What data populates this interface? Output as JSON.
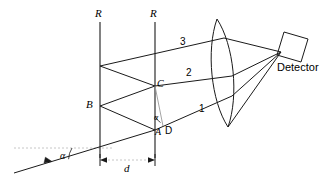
{
  "figure": {
    "type": "optics-ray-diagram",
    "width": 336,
    "height": 179,
    "background_color": "#ffffff",
    "line_color": "#000000",
    "guide_color": "#b0b0b0"
  },
  "labels": {
    "reflector_left": "R",
    "reflector_right": "R",
    "point_b": "B",
    "point_c": "C",
    "point_a": "A",
    "point_d": "D",
    "ray_1": "1",
    "ray_2": "2",
    "ray_3": "3",
    "angle_incidence": "α",
    "angle_interior": "α",
    "separation": "d",
    "detector": "Detector"
  },
  "elements": {
    "reflector_left_x": 100,
    "reflector_right_x": 155,
    "reflector_top_y": 22,
    "reflector_bottom_y": 158,
    "separation_dim_y": 160,
    "incident_angle_deg": 17,
    "lens_name": "converging-lens",
    "detector_name": "detector-box"
  },
  "geometry": {
    "point_a": [
      155,
      130
    ],
    "point_b": [
      100,
      106
    ],
    "point_c": [
      155,
      86
    ],
    "point_e": [
      100,
      66
    ],
    "ray1_end": [
      232,
      96
    ],
    "ray2_end": [
      232,
      76
    ],
    "ray3_end": [
      224,
      38
    ],
    "focus": [
      281,
      52
    ]
  }
}
